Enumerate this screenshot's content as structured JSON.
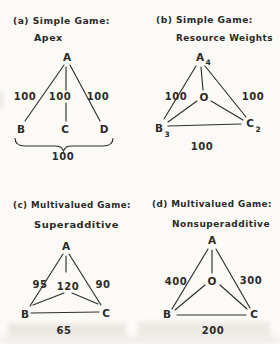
{
  "figure_title": "Apex and resource-weight game diagrams",
  "colors": {
    "ink": "#2a2a2a",
    "paper": "#fbfaf7"
  },
  "panel_a": {
    "caption1": "(a) Simple Game:",
    "caption2": "Apex",
    "node_a": "A",
    "node_b": "B",
    "node_c": "C",
    "node_d": "D",
    "edge_ab": "100",
    "edge_ac": "100",
    "edge_ad": "100",
    "brace_value": "100"
  },
  "panel_b": {
    "caption1": "(b) Simple Game:",
    "caption2": "Resource Weights",
    "node_a": "A",
    "node_a_sub": "4",
    "node_b": "B",
    "node_b_sub": "3",
    "node_c": "C",
    "node_c_sub": "2",
    "node_center": "O",
    "edge_left": "100",
    "edge_right": "100",
    "edge_bottom": "100"
  },
  "panel_c": {
    "caption1": "(c) Multivalued Game:",
    "caption2": "Superadditive",
    "node_a": "A",
    "node_b": "B",
    "node_c": "C",
    "center_value": "120",
    "edge_left": "95",
    "edge_right": "90",
    "edge_bottom": "65"
  },
  "panel_d": {
    "caption1": "(d) Multivalued Game:",
    "caption2": "Nonsuperadditive",
    "node_a": "A",
    "node_b": "B",
    "node_c": "C",
    "node_center": "O",
    "edge_left": "400",
    "edge_right": "300",
    "edge_bottom": "200"
  }
}
